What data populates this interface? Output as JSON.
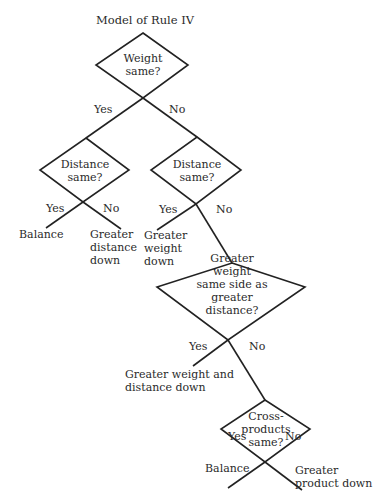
{
  "title": "Model of Rule IV",
  "nodes": {
    "weight_same": {
      "label": "Weight\nsame?",
      "yes": "Yes",
      "no": "No"
    },
    "distance_same_left": {
      "label": "Distance\nsame?",
      "yes": "Yes",
      "no": "No"
    },
    "distance_same_right": {
      "label": "Distance\nsame?",
      "yes": "Yes",
      "no": "No"
    },
    "greater_weight_same_side": {
      "label": "Greater\nweight\nsame side as\ngreater\ndistance?",
      "yes": "Yes",
      "no": "No"
    },
    "cross_products_same": {
      "label": "Cross-\nproducts\nsame?",
      "yes": "Yes",
      "no": "No"
    }
  },
  "outcomes": {
    "balance_1": "Balance",
    "greater_distance_down": "Greater\ndistance\ndown",
    "greater_weight_down": "Greater\nweight\ndown",
    "greater_weight_and_distance_down": "Greater weight and\ndistance down",
    "balance_2": "Balance",
    "greater_product_down": "Greater\nproduct down"
  },
  "colors": {
    "line": "#222222",
    "text": "#2a2a2a",
    "background": "#ffffff"
  }
}
